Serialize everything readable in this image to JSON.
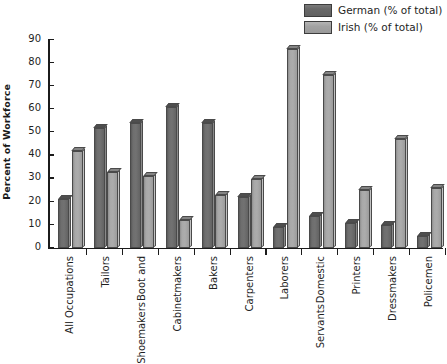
{
  "chart_data": {
    "type": "bar",
    "title": "",
    "xlabel": "",
    "ylabel": "Percent of Workforce",
    "ylim": [
      0,
      90
    ],
    "ytick_step": 10,
    "yticks": [
      0,
      10,
      20,
      30,
      40,
      50,
      60,
      70,
      80,
      90
    ],
    "grid": false,
    "legend_position": "top-right",
    "categories": [
      "All Occupations",
      "Tailors",
      "Boot and Shoemakers",
      "Cabinetmakers",
      "Bakers",
      "Carpenters",
      "Laborers",
      "Domestic Servants",
      "Printers",
      "Dressmakers",
      "Policemen"
    ],
    "category_lines": [
      [
        "All Occupations"
      ],
      [
        "Tailors"
      ],
      [
        "Boot and",
        "Shoemakers"
      ],
      [
        "Cabinetmakers"
      ],
      [
        "Bakers"
      ],
      [
        "Carpenters"
      ],
      [
        "Laborers"
      ],
      [
        "Domestic",
        "Servants"
      ],
      [
        "Printers"
      ],
      [
        "Dressmakers"
      ],
      [
        "Policemen"
      ]
    ],
    "series": [
      {
        "name": "German (% of total)",
        "color": "#6e6e6e",
        "values": [
          21,
          52,
          54,
          61,
          54,
          22,
          9,
          14,
          11,
          10,
          5
        ]
      },
      {
        "name": "Irish (% of total)",
        "color": "#a8a8a8",
        "values": [
          42,
          33,
          31,
          12,
          23,
          30,
          86,
          75,
          25,
          47,
          26
        ]
      }
    ]
  },
  "legend": {
    "items": [
      {
        "label": "German (% of total)",
        "swatch": "german"
      },
      {
        "label": "Irish (% of total)",
        "swatch": "irish"
      }
    ]
  },
  "axis": {
    "y_title": "Percent of Workforce"
  }
}
